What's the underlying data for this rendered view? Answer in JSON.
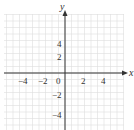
{
  "chart_data": {
    "type": "scatter",
    "title": "",
    "xlabel": "x",
    "ylabel": "y",
    "xlim": [
      -6,
      6
    ],
    "ylim": [
      -6,
      6
    ],
    "grid": true,
    "x_ticks": [
      -4,
      -2,
      0,
      2,
      4
    ],
    "y_ticks": [
      4,
      2,
      -2,
      -4
    ],
    "tick_labels": {
      "x": [
        "−4",
        "−2",
        "0",
        "2",
        "4"
      ],
      "y": [
        "4",
        "2",
        "−2",
        "−4"
      ]
    },
    "series": []
  },
  "axes": {
    "x_label": "x",
    "y_label": "y",
    "origin_label": "0"
  },
  "colors": {
    "axis": "#333333",
    "grid": "#dddddd",
    "text": "#333333"
  }
}
